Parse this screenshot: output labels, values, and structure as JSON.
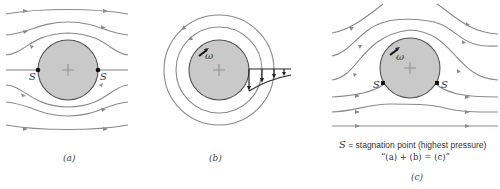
{
  "figure": {
    "panels": [
      {
        "id": "a",
        "caption": "(a)",
        "description": "Uniform flow past a stationary cylinder (symmetric streamlines)",
        "stagnation_labels": [
          "S",
          "S"
        ]
      },
      {
        "id": "b",
        "caption": "(b)",
        "description": "Rotating cylinder with circulating flow and velocity profile",
        "rotation_label": "ω"
      },
      {
        "id": "c",
        "caption": "(c)",
        "description": "Superposition: uniform flow plus rotation",
        "rotation_label": "ω",
        "stagnation_labels": [
          "S",
          "S"
        ]
      }
    ],
    "legend": {
      "symbol": "S",
      "definition": " = stagnation point (highest pressure)",
      "equation": "“(a) + (b) = (c)”"
    },
    "colors": {
      "streamline": "#8a8a8a",
      "cylinder_fill": "#c9c9c9",
      "cylinder_edge": "#555555",
      "stagnation_point": "#111111"
    }
  }
}
